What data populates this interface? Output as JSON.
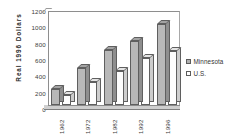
{
  "chart_data": {
    "type": "bar",
    "title": "",
    "subtitle": "",
    "xlabel": "",
    "ylabel": "Real  1996  Dollars",
    "categories": [
      "1962",
      "1972",
      "1982",
      "1992",
      "1996"
    ],
    "series": [
      {
        "name": "Minnesota",
        "color": "#b8b8b8",
        "values": [
          200,
          470,
          700,
          820,
          1035
        ]
      },
      {
        "name": "U.S.",
        "color": "#ffffff",
        "values": [
          130,
          290,
          440,
          600,
          690
        ]
      }
    ],
    "ylim": [
      0,
      1200
    ],
    "ytick_values": [
      0,
      200,
      400,
      600,
      800,
      1000,
      1200
    ],
    "ytick_labels": [
      "0",
      "200",
      "400",
      "600",
      "800",
      "1000",
      "1200"
    ],
    "grid": false,
    "legend_position": "right",
    "style": "3d-clustered-column"
  },
  "legend": {
    "entries": [
      {
        "label": "Minnesota",
        "swatch": "mn"
      },
      {
        "label": "U.S.",
        "swatch": "us"
      }
    ]
  }
}
